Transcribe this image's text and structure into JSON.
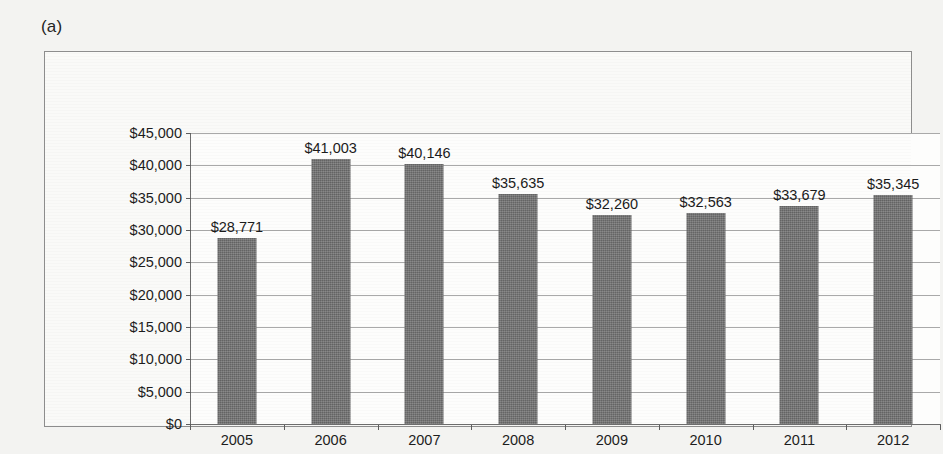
{
  "figure": {
    "panel_label": "(a)"
  },
  "chart_data": {
    "type": "bar",
    "title": "",
    "subtitle": "",
    "xlabel": "",
    "ylabel": "",
    "categories": [
      "2005",
      "2006",
      "2007",
      "2008",
      "2009",
      "2010",
      "2011",
      "2012"
    ],
    "values": [
      28771,
      41003,
      40146,
      35635,
      32260,
      32563,
      33679,
      35345
    ],
    "data_labels": [
      "$28,771",
      "$41,003",
      "$40,146",
      "$35,635",
      "$32,260",
      "$32,563",
      "$33,679",
      "$35,345"
    ],
    "ylim": [
      0,
      45000
    ],
    "ytick_values": [
      0,
      5000,
      10000,
      15000,
      20000,
      25000,
      30000,
      35000,
      40000,
      45000
    ],
    "ytick_labels": [
      "$0",
      "$5,000",
      "$10,000",
      "$15,000",
      "$20,000",
      "$25,000",
      "$30,000",
      "$35,000",
      "$40,000",
      "$45,000"
    ],
    "grid": true,
    "grid_axis": "y",
    "legend": false,
    "legend_position": "none",
    "series": [
      {
        "name": "",
        "values": [
          28771,
          41003,
          40146,
          35635,
          32260,
          32563,
          33679,
          35345
        ]
      }
    ]
  },
  "colors": {
    "bar_fill": "#6e6e6e",
    "gridline": "#a9a9a9",
    "axis_line": "#6d6d6d",
    "frame_border": "#8d8d8d",
    "plot_background": "#fdfdfc",
    "page_background": "#f3f3f1",
    "text": "#1d1d1d"
  }
}
